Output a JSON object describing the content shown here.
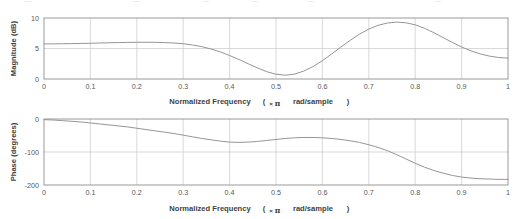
{
  "figure": {
    "background": "#ffffff",
    "width": 521,
    "height": 219,
    "ghost_row_note": "partially cropped text row at very top of image"
  },
  "style": {
    "curve_color": "#8c8c8c",
    "grid_color": "#c9c9c9",
    "axis_color": "#7a7a7a",
    "tick_text_color": "#585858",
    "title_text_color": "#3f3f3f"
  },
  "chart_data": [
    {
      "type": "line",
      "name": "magnitude-response",
      "title": "",
      "xlabel_parts": {
        "main": "Normalized Frequency",
        "open": "(",
        "times": "×",
        "pi": "π",
        "unit": "rad/sample",
        "close": ")"
      },
      "xlabel": "Normalized Frequency  (×π rad/sample)",
      "ylabel": "Magnitude (dB)",
      "xlim": [
        0,
        1
      ],
      "ylim": [
        0,
        10
      ],
      "grid": true,
      "xticks": [
        0,
        0.1,
        0.2,
        0.3,
        0.4,
        0.5,
        0.6,
        0.7,
        0.8,
        0.9,
        1
      ],
      "xticklabels": [
        "0",
        "0.1",
        "0.2",
        "0.3",
        "0.4",
        "0.5",
        "0.6",
        "0.7",
        "0.8",
        "0.9",
        "1"
      ],
      "yticks": [
        0,
        5,
        10
      ],
      "yticklabels": [
        "0",
        "5",
        "10"
      ],
      "x": [
        0.0,
        0.02,
        0.04,
        0.06,
        0.08,
        0.1,
        0.12,
        0.14,
        0.16,
        0.18,
        0.2,
        0.22,
        0.24,
        0.26,
        0.28,
        0.3,
        0.32,
        0.34,
        0.36,
        0.38,
        0.4,
        0.42,
        0.44,
        0.46,
        0.48,
        0.5,
        0.52,
        0.54,
        0.56,
        0.58,
        0.6,
        0.62,
        0.64,
        0.66,
        0.68,
        0.7,
        0.72,
        0.74,
        0.76,
        0.78,
        0.8,
        0.82,
        0.84,
        0.86,
        0.88,
        0.9,
        0.92,
        0.94,
        0.96,
        0.98,
        1.0
      ],
      "values": [
        5.75,
        5.76,
        5.78,
        5.8,
        5.83,
        5.86,
        5.9,
        5.94,
        5.97,
        6.0,
        6.02,
        6.02,
        6.01,
        5.97,
        5.9,
        5.78,
        5.58,
        5.3,
        4.92,
        4.44,
        3.85,
        3.2,
        2.5,
        1.82,
        1.2,
        0.78,
        0.62,
        0.8,
        1.3,
        2.05,
        3.0,
        4.1,
        5.25,
        6.35,
        7.35,
        8.18,
        8.8,
        9.18,
        9.32,
        9.22,
        8.88,
        8.32,
        7.6,
        6.8,
        6.0,
        5.25,
        4.62,
        4.12,
        3.75,
        3.52,
        3.42
      ]
    },
    {
      "type": "line",
      "name": "phase-response",
      "title": "",
      "xlabel_parts": {
        "main": "Normalized Frequency",
        "open": "(",
        "times": "×",
        "pi": "π",
        "unit": "rad/sample",
        "close": ")"
      },
      "xlabel": "Normalized Frequency  (×π rad/sample)",
      "ylabel": "Phase (degrees)",
      "xlim": [
        0,
        1
      ],
      "ylim": [
        -200,
        0
      ],
      "grid": true,
      "xticks": [
        0,
        0.1,
        0.2,
        0.3,
        0.4,
        0.5,
        0.6,
        0.7,
        0.8,
        0.9,
        1
      ],
      "xticklabels": [
        "0",
        "0.1",
        "0.2",
        "0.3",
        "0.4",
        "0.5",
        "0.6",
        "0.7",
        "0.8",
        "0.9",
        "1"
      ],
      "yticks": [
        0,
        -100,
        -200
      ],
      "yticklabels": [
        "0",
        "-100",
        "-200"
      ],
      "x": [
        0.0,
        0.02,
        0.04,
        0.06,
        0.08,
        0.1,
        0.12,
        0.14,
        0.16,
        0.18,
        0.2,
        0.22,
        0.24,
        0.26,
        0.28,
        0.3,
        0.32,
        0.34,
        0.36,
        0.38,
        0.4,
        0.42,
        0.44,
        0.46,
        0.48,
        0.5,
        0.52,
        0.54,
        0.56,
        0.58,
        0.6,
        0.62,
        0.64,
        0.66,
        0.68,
        0.7,
        0.72,
        0.74,
        0.76,
        0.78,
        0.8,
        0.82,
        0.84,
        0.86,
        0.88,
        0.9,
        0.92,
        0.94,
        0.96,
        0.98,
        1.0
      ],
      "values": [
        -2,
        -3,
        -5,
        -7,
        -9,
        -12,
        -15,
        -18,
        -21,
        -24,
        -28,
        -32,
        -36,
        -40,
        -44,
        -49,
        -54,
        -59,
        -63,
        -67,
        -70,
        -71,
        -70,
        -68,
        -65,
        -62,
        -59,
        -57,
        -56,
        -56,
        -57,
        -59,
        -62,
        -66,
        -71,
        -78,
        -86,
        -96,
        -108,
        -121,
        -134,
        -146,
        -156,
        -164,
        -171,
        -176,
        -179,
        -181,
        -182,
        -183,
        -183
      ]
    }
  ]
}
